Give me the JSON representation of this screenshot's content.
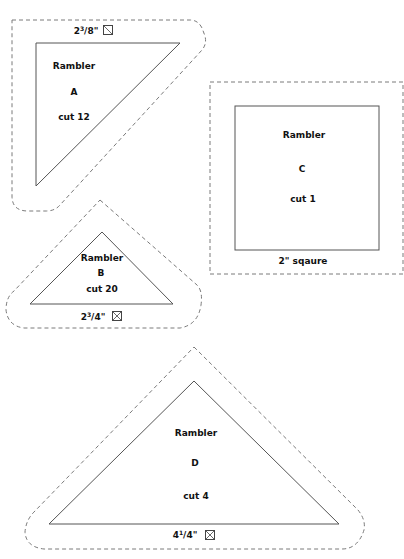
{
  "templates": [
    {
      "id": "A",
      "name": "Rambler",
      "letter": "A",
      "cut": "cut 12",
      "size_whole": "2",
      "size_num": "3",
      "size_den": "/8\"",
      "size_text": "2 3/8\"",
      "grain_icon": "half-square-diagonal-icon"
    },
    {
      "id": "B",
      "name": "Rambler",
      "letter": "B",
      "cut": "cut 20",
      "size_whole": "2",
      "size_num": "3",
      "size_den": "/4\"",
      "size_text": "2 3/4\"",
      "grain_icon": "quarter-square-cross-icon"
    },
    {
      "id": "C",
      "name": "Rambler",
      "letter": "C",
      "cut": "cut 1",
      "size_text": "2\" sqaure"
    },
    {
      "id": "D",
      "name": "Rambler",
      "letter": "D",
      "cut": "cut 4",
      "size_whole": "4",
      "size_num": "1",
      "size_den": "/4\"",
      "size_text": "4 1/4\"",
      "grain_icon": "quarter-square-cross-icon"
    }
  ],
  "colors": {
    "cut_line": "#555555",
    "seam_line": "#7a7a7a",
    "text": "#111111",
    "background": "#ffffff"
  }
}
